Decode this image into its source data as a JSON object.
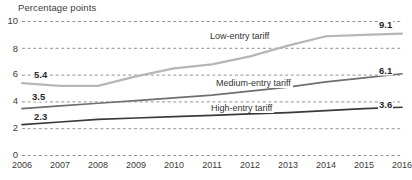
{
  "chart_data": {
    "type": "line",
    "title": "",
    "ylabel": "Percentage points",
    "xlabel": "",
    "categories": [
      "2006",
      "2007",
      "2008",
      "2009",
      "2010",
      "2011",
      "2012",
      "2013",
      "2014",
      "2015",
      "2016"
    ],
    "ylim": [
      0,
      10
    ],
    "yticks": [
      0,
      2,
      4,
      6,
      8,
      10
    ],
    "grid": true,
    "legend_position": "inline-labels",
    "series": [
      {
        "name": "Low-entry tariff",
        "color": "#b6b6b6",
        "values": [
          5.4,
          5.2,
          5.2,
          5.9,
          6.5,
          6.8,
          7.4,
          8.2,
          8.9,
          9.0,
          9.1
        ],
        "start_label": "5.4",
        "end_label": "9.1"
      },
      {
        "name": "Medium-entry tariff",
        "color": "#6f6f6f",
        "values": [
          3.5,
          3.7,
          3.9,
          4.1,
          4.3,
          4.5,
          4.8,
          5.1,
          5.5,
          5.8,
          6.1
        ],
        "start_label": "3.5",
        "end_label": "6.1"
      },
      {
        "name": "High-entry tariff",
        "color": "#3a3a3a",
        "values": [
          2.3,
          2.5,
          2.7,
          2.8,
          2.9,
          3.0,
          3.1,
          3.2,
          3.35,
          3.5,
          3.6
        ],
        "start_label": "2.3",
        "end_label": "3.6"
      }
    ]
  },
  "axis": {
    "y_title": "Percentage points",
    "y_ticks": [
      "10",
      "8",
      "6",
      "4",
      "2",
      "0"
    ],
    "x_ticks": [
      "2006",
      "2007",
      "2008",
      "2009",
      "2010",
      "2011",
      "2012",
      "2013",
      "2014",
      "2015",
      "2016"
    ]
  },
  "labels": {
    "low_series": "Low-entry tariff",
    "medium_series": "Medium-entry tariff",
    "high_series": "High-entry tariff",
    "low_start": "5.4",
    "low_end": "9.1",
    "medium_start": "3.5",
    "medium_end": "6.1",
    "high_start": "2.3",
    "high_end": "3.6"
  },
  "colors": {
    "low": "#b6b6b6",
    "medium": "#6f6f6f",
    "high": "#3a3a3a",
    "grid": "#888888",
    "text": "#3b3b3b"
  }
}
